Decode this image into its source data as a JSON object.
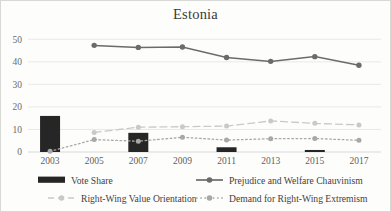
{
  "chart_data": {
    "type": "bar",
    "title": "Estonia",
    "xlabel": "",
    "ylabel": "",
    "categories": [
      "2003",
      "2005",
      "2007",
      "2009",
      "2011",
      "2013",
      "2015",
      "2017"
    ],
    "ylim": [
      0,
      55
    ],
    "yticks": [
      0,
      10,
      20,
      30,
      40,
      50
    ],
    "ytick_labels": [
      "0",
      "10",
      "20",
      "30",
      "40",
      "50"
    ],
    "grid": true,
    "legend_position": "bottom",
    "series": [
      {
        "name": "Vote Share",
        "type": "bar",
        "color": "#262626",
        "values": [
          16.0,
          null,
          8.5,
          null,
          2.1,
          null,
          0.9,
          null
        ]
      },
      {
        "name": "Prejudice and Welfare Chauvinism",
        "type": "line",
        "style": "solid",
        "color": "#6b6b6b",
        "values": [
          null,
          47.3,
          46.4,
          46.6,
          41.9,
          40.2,
          42.3,
          38.5
        ]
      },
      {
        "name": "Right-Wing Value Orientation",
        "type": "line",
        "style": "dashed",
        "color": "#c9c9c9",
        "values": [
          null,
          8.7,
          11.0,
          11.2,
          11.5,
          13.8,
          12.7,
          12.0
        ]
      },
      {
        "name": "Demand for Right-Wing Extremism",
        "type": "line",
        "style": "dotted",
        "color": "#a8a8a8",
        "values": [
          0.3,
          5.5,
          4.8,
          6.5,
          5.3,
          5.9,
          6.0,
          5.2
        ]
      }
    ]
  },
  "legend": {
    "items": [
      {
        "label": "Vote Share",
        "marker": "bar-swatch",
        "color": "#262626"
      },
      {
        "label": "Prejudice and Welfare Chauvinism",
        "marker": "solid-line-dot",
        "color": "#6b6b6b"
      },
      {
        "label": "Right-Wing Value Orientation",
        "marker": "dashed-line-dot",
        "color": "#c9c9c9"
      },
      {
        "label": "Demand for Right-Wing Extremism",
        "marker": "dotted-line-dot",
        "color": "#a8a8a8"
      }
    ]
  }
}
